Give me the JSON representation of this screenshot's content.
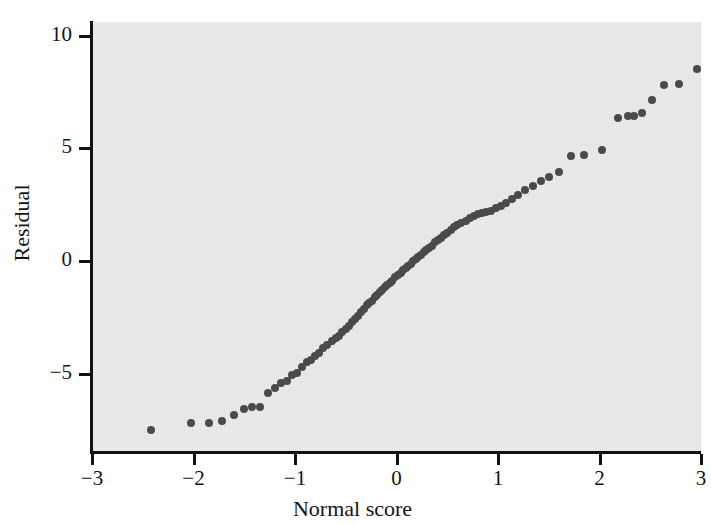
{
  "chart_data": {
    "type": "scatter",
    "title": "",
    "xlabel": "Normal score",
    "ylabel": "Residual",
    "xlim": [
      -3,
      3
    ],
    "ylim": [
      -8.4,
      10.6
    ],
    "xticks": [
      -3,
      -2,
      -1,
      0,
      1,
      2,
      3
    ],
    "xtick_labels": [
      "−3",
      "−2",
      "−1",
      "0",
      "1",
      "2",
      "3"
    ],
    "yticks": [
      -5,
      0,
      5,
      10
    ],
    "ytick_labels": [
      "−5",
      "0",
      "5",
      "10"
    ],
    "grid": false,
    "legend": null,
    "marker": {
      "shape": "circle",
      "color": "#4a4a4a",
      "size_px": 8
    },
    "panel_background": "#e9e9e9",
    "page_background": "#ffffff",
    "axis_color": "#111111",
    "points": [
      [
        -2.42,
        -7.45
      ],
      [
        -2.02,
        -7.15
      ],
      [
        -1.85,
        -7.15
      ],
      [
        -1.72,
        -7.05
      ],
      [
        -1.6,
        -6.8
      ],
      [
        -1.5,
        -6.55
      ],
      [
        -1.42,
        -6.45
      ],
      [
        -1.34,
        -6.45
      ],
      [
        -1.27,
        -5.85
      ],
      [
        -1.2,
        -5.6
      ],
      [
        -1.14,
        -5.4
      ],
      [
        -1.08,
        -5.3
      ],
      [
        -1.03,
        -5.05
      ],
      [
        -0.98,
        -4.95
      ],
      [
        -0.93,
        -4.7
      ],
      [
        -0.88,
        -4.45
      ],
      [
        -0.84,
        -4.35
      ],
      [
        -0.8,
        -4.2
      ],
      [
        -0.76,
        -4.05
      ],
      [
        -0.72,
        -3.85
      ],
      [
        -0.68,
        -3.7
      ],
      [
        -0.64,
        -3.55
      ],
      [
        -0.6,
        -3.4
      ],
      [
        -0.57,
        -3.3
      ],
      [
        -0.54,
        -3.15
      ],
      [
        -0.5,
        -3.0
      ],
      [
        -0.47,
        -2.85
      ],
      [
        -0.44,
        -2.7
      ],
      [
        -0.41,
        -2.55
      ],
      [
        -0.38,
        -2.4
      ],
      [
        -0.35,
        -2.25
      ],
      [
        -0.32,
        -2.1
      ],
      [
        -0.29,
        -1.95
      ],
      [
        -0.27,
        -1.85
      ],
      [
        -0.24,
        -1.75
      ],
      [
        -0.21,
        -1.6
      ],
      [
        -0.19,
        -1.5
      ],
      [
        -0.16,
        -1.35
      ],
      [
        -0.14,
        -1.25
      ],
      [
        -0.11,
        -1.15
      ],
      [
        -0.09,
        -1.05
      ],
      [
        -0.06,
        -0.95
      ],
      [
        -0.04,
        -0.85
      ],
      [
        -0.01,
        -0.7
      ],
      [
        0.01,
        -0.6
      ],
      [
        0.04,
        -0.5
      ],
      [
        0.06,
        -0.4
      ],
      [
        0.09,
        -0.3
      ],
      [
        0.11,
        -0.2
      ],
      [
        0.14,
        -0.1
      ],
      [
        0.16,
        0.0
      ],
      [
        0.19,
        0.1
      ],
      [
        0.21,
        0.2
      ],
      [
        0.24,
        0.3
      ],
      [
        0.27,
        0.4
      ],
      [
        0.29,
        0.5
      ],
      [
        0.32,
        0.6
      ],
      [
        0.35,
        0.7
      ],
      [
        0.38,
        0.85
      ],
      [
        0.41,
        0.95
      ],
      [
        0.44,
        1.05
      ],
      [
        0.47,
        1.15
      ],
      [
        0.5,
        1.25
      ],
      [
        0.54,
        1.4
      ],
      [
        0.57,
        1.5
      ],
      [
        0.6,
        1.6
      ],
      [
        0.64,
        1.7
      ],
      [
        0.68,
        1.8
      ],
      [
        0.72,
        1.9
      ],
      [
        0.76,
        2.0
      ],
      [
        0.8,
        2.1
      ],
      [
        0.84,
        2.15
      ],
      [
        0.88,
        2.2
      ],
      [
        0.93,
        2.25
      ],
      [
        0.98,
        2.35
      ],
      [
        1.03,
        2.45
      ],
      [
        1.08,
        2.6
      ],
      [
        1.14,
        2.75
      ],
      [
        1.2,
        2.95
      ],
      [
        1.27,
        3.15
      ],
      [
        1.34,
        3.35
      ],
      [
        1.42,
        3.55
      ],
      [
        1.5,
        3.75
      ],
      [
        1.6,
        3.95
      ],
      [
        1.72,
        4.65
      ],
      [
        1.85,
        4.7
      ],
      [
        2.02,
        4.95
      ],
      [
        2.18,
        6.35
      ],
      [
        2.28,
        6.45
      ],
      [
        2.34,
        6.45
      ],
      [
        2.42,
        6.55
      ],
      [
        2.52,
        7.15
      ],
      [
        2.64,
        7.8
      ],
      [
        2.78,
        7.85
      ],
      [
        2.96,
        8.5
      ]
    ]
  },
  "axes": {
    "y_title": "Residual",
    "x_title": "Normal score",
    "y_tick_labels": [
      "10",
      "5",
      "0",
      "−5"
    ],
    "x_tick_labels": [
      "−3",
      "−2",
      "−1",
      "0",
      "1",
      "2",
      "3"
    ]
  }
}
